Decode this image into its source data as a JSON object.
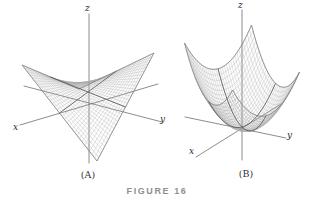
{
  "figure": {
    "caption": "FIGURE 16"
  },
  "colors": {
    "background": "#ffffff",
    "mesh": "#a9a9a9",
    "mesh_edge": "#7d7d7d",
    "trace": "#5f5f5f",
    "axis": "#6e6e6e",
    "axis_label": "#2b2b2b",
    "caption": "#8e8e8e"
  },
  "chart_data": [
    {
      "type": "surface",
      "panel_label": "(A)",
      "shape": "hyperbolic-paraboloid",
      "equation_estimate": "z = -xy (saddle surface)",
      "axis_labels": {
        "x": "x",
        "y": "y",
        "z": "z"
      },
      "domain": {
        "u": [
          -1,
          1
        ],
        "v": [
          -1,
          1
        ]
      },
      "mesh_n": 30,
      "projection": {
        "center": [
          88,
          92
        ],
        "ex": [
          -28.5,
          21
        ],
        "ey": [
          37.5,
          15
        ],
        "zscale": 33
      },
      "axes": {
        "z": [
          [
            89,
            14
          ],
          [
            89,
            163
          ]
        ],
        "x": [
          [
            20,
            125
          ],
          [
            158,
            84
          ]
        ],
        "y": [
          [
            24,
            86
          ],
          [
            162,
            122
          ]
        ]
      }
    },
    {
      "type": "surface",
      "panel_label": "(B)",
      "shape": "elliptic-paraboloid",
      "equation_estimate": "z = x^2 + y^2 (bowl)",
      "axis_labels": {
        "x": "x",
        "y": "y",
        "z": "z"
      },
      "domain": {
        "u": [
          -1,
          1
        ],
        "v": [
          -1,
          1
        ]
      },
      "mesh_n": 32,
      "projection": {
        "center": [
          242,
          127
        ],
        "ex": [
          -33.5,
          9
        ],
        "ey": [
          24,
          23.5
        ],
        "zscale": 69.5
      },
      "axes": {
        "z": [
          [
            242,
            10
          ],
          [
            242,
            160
          ]
        ],
        "x": [
          [
            196,
            157
          ],
          [
            281,
            104
          ]
        ],
        "y": [
          [
            185,
            117
          ],
          [
            286,
            138
          ]
        ]
      }
    }
  ]
}
